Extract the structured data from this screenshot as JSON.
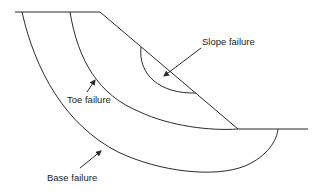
{
  "diagram": {
    "labels": {
      "slope": "Slope failure",
      "toe": "Toe failure",
      "base": "Base failure"
    },
    "colors": {
      "line": "#2a2a2a",
      "text": "#222222",
      "background": "#ffffff"
    }
  }
}
